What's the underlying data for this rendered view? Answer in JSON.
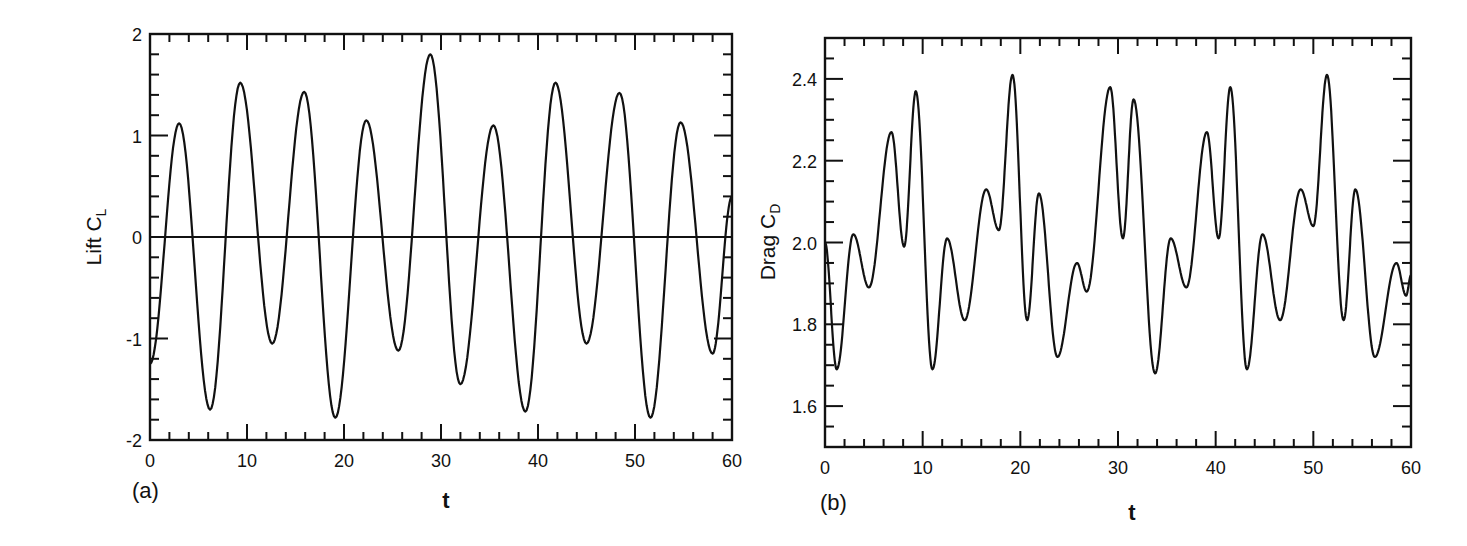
{
  "figure": {
    "panels": [
      {
        "id": "a",
        "panel_label": "(a)",
        "ylabel_main": "Lift C",
        "ylabel_sub": "L",
        "xlabel": "t"
      },
      {
        "id": "b",
        "panel_label": "(b)",
        "ylabel_main": "Drag C",
        "ylabel_sub": "D",
        "xlabel": "t"
      }
    ]
  },
  "chart_data": [
    {
      "type": "line",
      "title": "",
      "panel_label": "(a)",
      "xlabel": "t",
      "ylabel": "Lift C_L",
      "xlim": [
        0,
        60
      ],
      "ylim": [
        -2,
        2
      ],
      "xticks": [
        0,
        10,
        20,
        30,
        40,
        50,
        60
      ],
      "xtick_labels": [
        "0",
        "10",
        "20",
        "30",
        "40",
        "50",
        "60"
      ],
      "yticks": [
        -2,
        -1,
        0,
        1,
        2
      ],
      "ytick_labels": [
        "-2",
        "-1",
        "0",
        "1",
        "2"
      ],
      "grid": false,
      "reference_line": {
        "y": 0
      },
      "series": [
        {
          "name": "C_L",
          "extrema": [
            {
              "t": 0.0,
              "v": -1.25
            },
            {
              "t": 3.0,
              "v": 1.12
            },
            {
              "t": 6.2,
              "v": -1.7
            },
            {
              "t": 9.3,
              "v": 1.52
            },
            {
              "t": 12.6,
              "v": -1.05
            },
            {
              "t": 15.9,
              "v": 1.43
            },
            {
              "t": 19.1,
              "v": -1.78
            },
            {
              "t": 22.3,
              "v": 1.15
            },
            {
              "t": 25.6,
              "v": -1.12
            },
            {
              "t": 28.9,
              "v": 1.8
            },
            {
              "t": 32.0,
              "v": -1.45
            },
            {
              "t": 35.4,
              "v": 1.1
            },
            {
              "t": 38.7,
              "v": -1.72
            },
            {
              "t": 41.8,
              "v": 1.52
            },
            {
              "t": 45.0,
              "v": -1.05
            },
            {
              "t": 48.4,
              "v": 1.42
            },
            {
              "t": 51.6,
              "v": -1.78
            },
            {
              "t": 54.7,
              "v": 1.13
            },
            {
              "t": 58.0,
              "v": -1.15
            },
            {
              "t": 60.0,
              "v": 0.4
            }
          ]
        }
      ]
    },
    {
      "type": "line",
      "title": "",
      "panel_label": "(b)",
      "xlabel": "t",
      "ylabel": "Drag C_D",
      "xlim": [
        0,
        60
      ],
      "ylim": [
        1.5,
        2.5
      ],
      "xticks": [
        0,
        10,
        20,
        30,
        40,
        50,
        60
      ],
      "xtick_labels": [
        "0",
        "10",
        "20",
        "30",
        "40",
        "50",
        "60"
      ],
      "yticks": [
        1.6,
        1.8,
        2.0,
        2.2,
        2.4
      ],
      "ytick_labels": [
        "1.6",
        "1.8",
        "2.0",
        "2.2",
        "2.4"
      ],
      "grid": false,
      "series": [
        {
          "name": "C_D",
          "extrema": [
            {
              "t": 0.0,
              "v": 2.0
            },
            {
              "t": 1.2,
              "v": 1.69
            },
            {
              "t": 2.9,
              "v": 2.02
            },
            {
              "t": 4.5,
              "v": 1.89
            },
            {
              "t": 6.8,
              "v": 2.27
            },
            {
              "t": 8.1,
              "v": 1.99
            },
            {
              "t": 9.3,
              "v": 2.37
            },
            {
              "t": 11.0,
              "v": 1.69
            },
            {
              "t": 12.5,
              "v": 2.01
            },
            {
              "t": 14.3,
              "v": 1.81
            },
            {
              "t": 16.5,
              "v": 2.13
            },
            {
              "t": 17.8,
              "v": 2.03
            },
            {
              "t": 19.2,
              "v": 2.41
            },
            {
              "t": 20.7,
              "v": 1.81
            },
            {
              "t": 21.9,
              "v": 2.12
            },
            {
              "t": 23.8,
              "v": 1.72
            },
            {
              "t": 25.8,
              "v": 1.95
            },
            {
              "t": 26.8,
              "v": 1.88
            },
            {
              "t": 29.2,
              "v": 2.38
            },
            {
              "t": 30.5,
              "v": 2.01
            },
            {
              "t": 31.6,
              "v": 2.35
            },
            {
              "t": 33.8,
              "v": 1.68
            },
            {
              "t": 35.4,
              "v": 2.01
            },
            {
              "t": 37.0,
              "v": 1.89
            },
            {
              "t": 39.1,
              "v": 2.27
            },
            {
              "t": 40.3,
              "v": 2.01
            },
            {
              "t": 41.5,
              "v": 2.38
            },
            {
              "t": 43.2,
              "v": 1.69
            },
            {
              "t": 44.8,
              "v": 2.02
            },
            {
              "t": 46.6,
              "v": 1.81
            },
            {
              "t": 48.7,
              "v": 2.13
            },
            {
              "t": 50.0,
              "v": 2.04
            },
            {
              "t": 51.4,
              "v": 2.41
            },
            {
              "t": 53.1,
              "v": 1.81
            },
            {
              "t": 54.3,
              "v": 2.13
            },
            {
              "t": 56.3,
              "v": 1.72
            },
            {
              "t": 58.5,
              "v": 1.95
            },
            {
              "t": 59.5,
              "v": 1.87
            },
            {
              "t": 60.0,
              "v": 1.92
            }
          ]
        }
      ]
    }
  ]
}
